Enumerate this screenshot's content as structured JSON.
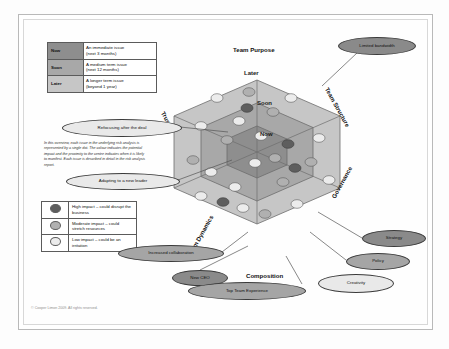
{
  "slide": {
    "footer": "© Cooper Limon 2009. All rights reserved."
  },
  "timing_legend": {
    "rows": [
      {
        "key": "Now",
        "desc_line1": "An immediate issue",
        "desc_line2": "(next 3 months)"
      },
      {
        "key": "Soon",
        "desc_line1": "A medium term issue",
        "desc_line2": "(next 12 months)"
      },
      {
        "key": "Later",
        "desc_line1": "A longer term issue",
        "desc_line2": "(beyond 1 year)"
      }
    ]
  },
  "description": "In this overview, each issue in the underlying risk analysis is represented by a single dot. The colour indicates the potential impact and the proximity to the centre indicates when it is likely to manifest. Each issue is described in detail in the risk analysis report.",
  "impact_legend": {
    "rows": [
      {
        "swatch": "high-impact-dot",
        "label": "High impact – could disrupt the business"
      },
      {
        "swatch": "moderate-impact-dot",
        "label": "Moderate impact – could stretch resources"
      },
      {
        "swatch": "low-impact-dot",
        "label": "Low impact – could be an irritation"
      }
    ]
  },
  "hexagon": {
    "axes": [
      {
        "id": "team-purpose",
        "label": "Team Purpose"
      },
      {
        "id": "team-structure",
        "label": "Team Structure"
      },
      {
        "id": "governance",
        "label": "Governance"
      },
      {
        "id": "composition",
        "label": "Composition"
      },
      {
        "id": "team-dynamics",
        "label": "Team Dynamics"
      },
      {
        "id": "trust",
        "label": "Trust"
      }
    ],
    "rings": [
      {
        "id": "later",
        "label": "Later"
      },
      {
        "id": "soon",
        "label": "Soon"
      },
      {
        "id": "now",
        "label": "Now"
      }
    ]
  },
  "callouts": [
    {
      "id": "refocusing-after-the-deal",
      "label": "Refocusing after the deal",
      "style": "light"
    },
    {
      "id": "adapting-to-a-new-leader",
      "label": "Adapting to a new leader",
      "style": "light"
    },
    {
      "id": "increased-collaboration",
      "label": "Increased collaboration",
      "style": "mid"
    },
    {
      "id": "new-ceo",
      "label": "New CEO",
      "style": "dark"
    },
    {
      "id": "top-team-experience",
      "label": "Top Team Experience",
      "style": "mid"
    },
    {
      "id": "creativity",
      "label": "Creativity",
      "style": "light"
    },
    {
      "id": "policy",
      "label": "Policy",
      "style": "mid"
    },
    {
      "id": "strategy",
      "label": "Strategy",
      "style": "dark"
    },
    {
      "id": "limited-bandwidth",
      "label": "Limited bandwidth",
      "style": "dark"
    }
  ],
  "colors": {
    "ring_later": "#c6c6c6",
    "ring_soon": "#a8a8a8",
    "ring_now": "#8e8e8e",
    "impact_high": "#5e5e5e",
    "impact_moderate": "#b0b0b0",
    "impact_low": "#ececec",
    "outline": "#5b5b5b"
  }
}
